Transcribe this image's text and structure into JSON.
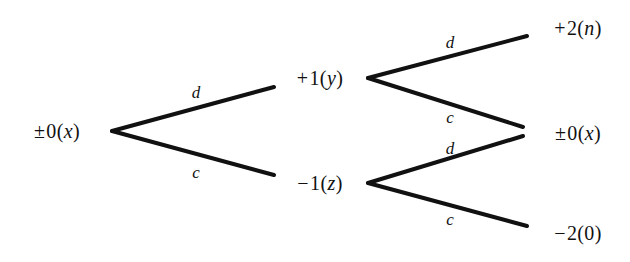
{
  "diagram": {
    "type": "binary-tree",
    "background_color": "#ffffff",
    "line_color": "#111111",
    "nodes": [
      {
        "id": "root",
        "sign": "±",
        "number": "0",
        "open": "(",
        "variable": "x",
        "close": ")",
        "text": "± 0(x)",
        "x": 57,
        "y": 131
      },
      {
        "id": "upper-mid",
        "sign": "+",
        "number": "1",
        "open": "(",
        "variable": "y",
        "close": ")",
        "text": "+ 1(y)",
        "x": 320,
        "y": 78
      },
      {
        "id": "lower-mid",
        "sign": "−",
        "number": "1",
        "open": "(",
        "variable": "z",
        "close": ")",
        "text": "− 1(z)",
        "x": 320,
        "y": 183
      },
      {
        "id": "leaf-top",
        "sign": "+",
        "number": "2",
        "open": "(",
        "variable": "n",
        "close": ")",
        "text": "+ 2(n)",
        "x": 578,
        "y": 28
      },
      {
        "id": "leaf-middle",
        "sign": "±",
        "number": "0",
        "open": "(",
        "variable": "x",
        "close": ")",
        "text": "± 0(x)",
        "x": 578,
        "y": 133
      },
      {
        "id": "leaf-bottom",
        "sign": "−",
        "number": "2",
        "open": "(",
        "variable": "0",
        "close": ")",
        "text": "− 2(0)",
        "x": 578,
        "y": 233
      }
    ],
    "edges": [
      {
        "id": "root-to-upper-mid",
        "label": "d",
        "from": "root",
        "to": "upper-mid",
        "x1": 112,
        "y1": 131,
        "x2": 274,
        "y2": 87,
        "label_x": 196,
        "label_y": 92
      },
      {
        "id": "root-to-lower-mid",
        "label": "c",
        "from": "root",
        "to": "lower-mid",
        "x1": 112,
        "y1": 131,
        "x2": 274,
        "y2": 175,
        "label_x": 196,
        "label_y": 172
      },
      {
        "id": "upper-mid-to-leaf-top",
        "label": "d",
        "from": "upper-mid",
        "to": "leaf-top",
        "x1": 368,
        "y1": 78,
        "x2": 527,
        "y2": 36,
        "label_x": 450,
        "label_y": 42
      },
      {
        "id": "upper-mid-to-leaf-middle",
        "label": "c",
        "from": "upper-mid",
        "to": "leaf-middle",
        "x1": 368,
        "y1": 78,
        "x2": 523,
        "y2": 127,
        "label_x": 450,
        "label_y": 117
      },
      {
        "id": "lower-mid-to-leaf-middle",
        "label": "d",
        "from": "lower-mid",
        "to": "leaf-middle",
        "x1": 368,
        "y1": 183,
        "x2": 523,
        "y2": 136,
        "label_x": 450,
        "label_y": 148
      },
      {
        "id": "lower-mid-to-leaf-bottom",
        "label": "c",
        "from": "lower-mid",
        "to": "leaf-bottom",
        "x1": 368,
        "y1": 183,
        "x2": 527,
        "y2": 226,
        "label_x": 450,
        "label_y": 219
      }
    ]
  }
}
